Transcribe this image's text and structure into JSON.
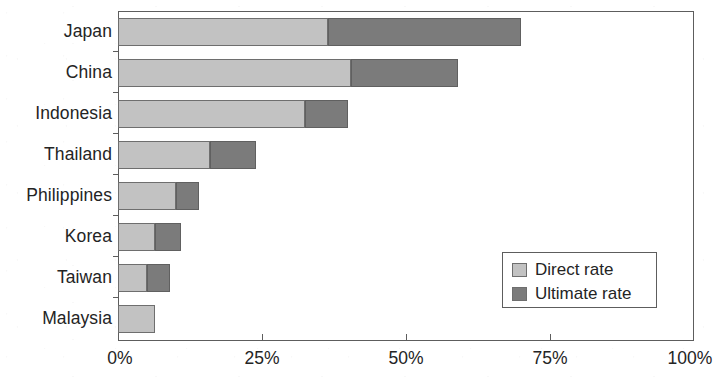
{
  "chart_data": {
    "type": "bar",
    "orientation": "horizontal",
    "stacked": true,
    "title": "",
    "subtitle": "",
    "xlabel": "",
    "ylabel": "",
    "categories": [
      "Japan",
      "China",
      "Indonesia",
      "Thailand",
      "Philippines",
      "Korea",
      "Taiwan",
      "Malaysia"
    ],
    "series": [
      {
        "name": "Direct rate",
        "color": "#c2c2c2",
        "values": [
          36.5,
          40.5,
          32.5,
          16.0,
          10.0,
          6.5,
          5.0,
          6.5
        ]
      },
      {
        "name": "Ultimate rate",
        "color": "#7b7b7b",
        "values": [
          33.5,
          18.5,
          7.5,
          8.0,
          4.0,
          4.5,
          4.0,
          0.0
        ]
      }
    ],
    "totals": [
      70.0,
      59.0,
      40.0,
      24.0,
      14.0,
      11.0,
      9.0,
      6.5
    ],
    "xlim": [
      0,
      100
    ],
    "xticks": [
      0,
      25,
      50,
      75,
      100
    ],
    "xtick_labels": [
      "0%",
      "25%",
      "50%",
      "75%",
      "100%"
    ],
    "grid": false,
    "legend_position": "inside-bottom-right",
    "legend_entries": [
      "Direct rate",
      "Ultimate rate"
    ]
  },
  "legend": {
    "items": [
      {
        "label": "Direct rate",
        "color": "#c2c2c2"
      },
      {
        "label": "Ultimate rate",
        "color": "#7b7b7b"
      }
    ]
  }
}
